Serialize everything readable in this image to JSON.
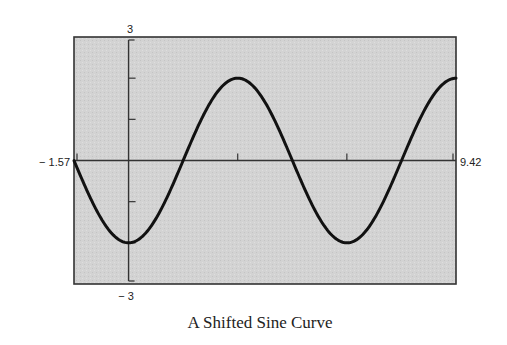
{
  "chart_data": {
    "type": "line",
    "title": "A Shifted Sine Curve",
    "function": "y = -2cos(x) = 2sin(x - π/2)",
    "xlabel": "",
    "ylabel": "",
    "xlim": [
      -1.57,
      9.42
    ],
    "ylim": [
      -3,
      3
    ],
    "x_range_labels": {
      "min": "− 1.57",
      "max": "9.42"
    },
    "y_range_labels": {
      "max": "3",
      "min": "− 3"
    },
    "x_ticks": [
      3.14,
      6.28,
      9.42
    ],
    "y_ticks": [
      -2,
      -1,
      1,
      2
    ],
    "grid": false,
    "legend": null,
    "series": [
      {
        "name": "y = -2cos(x)",
        "x": [
          -1.57,
          -0.785,
          0,
          0.785,
          1.57,
          2.356,
          3.14,
          3.927,
          4.71,
          5.498,
          6.28,
          7.069,
          7.85,
          8.639,
          9.42
        ],
        "values": [
          0,
          -1.41,
          -2,
          -1.41,
          0,
          1.41,
          2,
          1.41,
          0,
          -1.41,
          -2,
          -1.41,
          0,
          1.41,
          2
        ]
      }
    ],
    "colors": {
      "background": "#d2d2d2",
      "line": "#111111",
      "frame": "#333333"
    }
  }
}
